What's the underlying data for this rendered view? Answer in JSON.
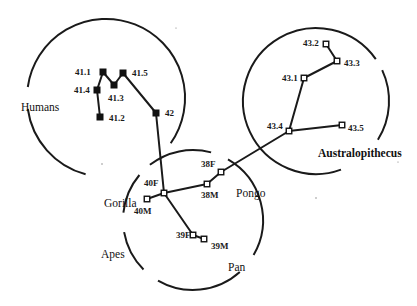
{
  "diagram": {
    "title": "",
    "groups": [
      {
        "id": "humans",
        "label": "Humans"
      },
      {
        "id": "australopithecus",
        "label": "Australopithecus"
      },
      {
        "id": "apes",
        "label": "Apes",
        "sublabels": [
          "Gorilla",
          "Pongo",
          "Pan"
        ]
      }
    ],
    "nodes": [
      {
        "id": "41.1",
        "label": "41.1",
        "group": "humans",
        "marker": "filled"
      },
      {
        "id": "41.2",
        "label": "41.2",
        "group": "humans",
        "marker": "filled"
      },
      {
        "id": "41.3",
        "label": "41.3",
        "group": "humans",
        "marker": "filled"
      },
      {
        "id": "41.4",
        "label": "41.4",
        "group": "humans",
        "marker": "filled"
      },
      {
        "id": "41.5",
        "label": "41.5",
        "group": "humans",
        "marker": "filled"
      },
      {
        "id": "42",
        "label": "42",
        "group": "humans",
        "marker": "filled"
      },
      {
        "id": "43.1",
        "label": "43.1",
        "group": "australopithecus",
        "marker": "open"
      },
      {
        "id": "43.2",
        "label": "43.2",
        "group": "australopithecus",
        "marker": "open"
      },
      {
        "id": "43.3",
        "label": "43.3",
        "group": "australopithecus",
        "marker": "open"
      },
      {
        "id": "43.4",
        "label": "43.4",
        "group": "australopithecus",
        "marker": "open"
      },
      {
        "id": "43.5",
        "label": "43.5",
        "group": "australopithecus",
        "marker": "open"
      },
      {
        "id": "38F",
        "label": "38F",
        "group": "apes",
        "marker": "open"
      },
      {
        "id": "38M",
        "label": "38M",
        "group": "apes",
        "marker": "open"
      },
      {
        "id": "39F",
        "label": "39F",
        "group": "apes",
        "marker": "open"
      },
      {
        "id": "39M",
        "label": "39M",
        "group": "apes",
        "marker": "open"
      },
      {
        "id": "40F",
        "label": "40F",
        "group": "apes",
        "marker": "open"
      },
      {
        "id": "40M",
        "label": "40M",
        "group": "apes",
        "marker": "open"
      }
    ],
    "edges": [
      [
        "41.1",
        "41.4"
      ],
      [
        "41.4",
        "41.2"
      ],
      [
        "41.1",
        "41.3"
      ],
      [
        "41.3",
        "41.5"
      ],
      [
        "41.5",
        "42"
      ],
      [
        "42",
        "40F"
      ],
      [
        "43.2",
        "43.3"
      ],
      [
        "43.3",
        "43.1"
      ],
      [
        "43.1",
        "43.4"
      ],
      [
        "43.4",
        "43.5"
      ],
      [
        "43.4",
        "38F"
      ],
      [
        "38F",
        "38M"
      ],
      [
        "38M",
        "40F"
      ],
      [
        "40F",
        "40M"
      ],
      [
        "40F",
        "39F"
      ],
      [
        "39F",
        "39M"
      ]
    ]
  }
}
